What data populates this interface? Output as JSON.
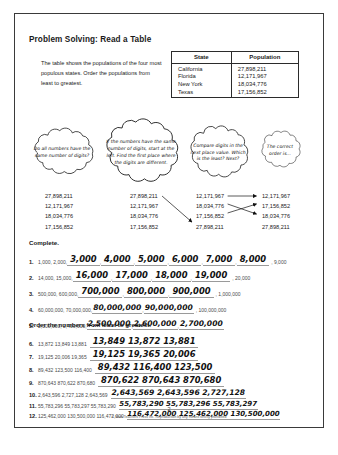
{
  "worksheet": {
    "title": "Problem Solving: Read a Table",
    "intro": "The table shows the populations of the four most populous states. Order the populations from least to greatest."
  },
  "table": {
    "headers": [
      "State",
      "Population"
    ],
    "rows": [
      {
        "state": "California",
        "population": "27,898,211"
      },
      {
        "state": "Florida",
        "population": "12,171,967"
      },
      {
        "state": "New York",
        "population": "18,034,776"
      },
      {
        "state": "Texas",
        "population": "17,156,852"
      }
    ]
  },
  "clouds": [
    {
      "id": "cloud-1",
      "text": "Do all numbers have the same number of digits?"
    },
    {
      "id": "cloud-2",
      "text": "If the numbers have the same number of digits, start at the left. Find the first place where the digits are different."
    },
    {
      "id": "cloud-3",
      "text": "Compare digits in the next place value. Which is the least? Next?"
    },
    {
      "id": "cloud-4",
      "text": "The correct order is..."
    }
  ],
  "number_columns": [
    {
      "name": "column-1",
      "values": [
        "27,898,211",
        "12,171,967",
        "18,034,776",
        "17,156,852"
      ]
    },
    {
      "name": "column-2",
      "values": [
        "27,898,211",
        "12,171,967",
        "18,034,776",
        "17,156,852"
      ]
    },
    {
      "name": "column-3",
      "values": [
        "12,171,967",
        "18,034,776",
        "17,156,852",
        "27,898,211"
      ]
    },
    {
      "name": "column-4",
      "values": [
        "12,171,967",
        "17,156,852",
        "18,034,776",
        "27,898,211"
      ]
    }
  ],
  "sections": {
    "complete": "Complete.",
    "order": "Order the numbers from least to greatest."
  },
  "complete_items": [
    {
      "n": "1.",
      "lead": "1,000, 2,000,",
      "answers": [
        "3,000",
        "4,000",
        "5,000",
        "6,000",
        "7,000",
        "8,000"
      ],
      "tail": "9,000"
    },
    {
      "n": "2.",
      "lead": "14,000, 15,000,",
      "answers": [
        "16,000",
        "17,000",
        "18,000",
        "19,000"
      ],
      "tail": "20,000"
    },
    {
      "n": "3.",
      "lead": "500,000, 600,000,",
      "answers": [
        "700,000",
        "800,000",
        "900,000"
      ],
      "tail": "1,000,000"
    },
    {
      "n": "4.",
      "lead": "60,000,000, 70,000,000,",
      "answers": [
        "80,000,000",
        "90,000,000"
      ],
      "tail": "100,000,000"
    },
    {
      "n": "5.",
      "lead": "2,300,000, 2,400,000,",
      "answers": [
        "2,500,000",
        "2,600,000",
        "2,700,000"
      ],
      "tail": ""
    }
  ],
  "order_items": [
    {
      "n": "6.",
      "given": "13,872    13,849    13,881",
      "answers": [
        "13,849",
        "13,872",
        "13,881"
      ]
    },
    {
      "n": "7.",
      "given": "19,125    20,006    19,365",
      "answers": [
        "19,125",
        "19,365",
        "20,006"
      ]
    },
    {
      "n": "8.",
      "given": "89,432    123,500    116,400",
      "answers": [
        "89,432",
        "116,400",
        "123,500"
      ]
    },
    {
      "n": "9.",
      "given": "870,643    870,622    870,680",
      "answers": [
        "870,622",
        "870,643",
        "870,680"
      ]
    },
    {
      "n": "10.",
      "given": "2,643,596    2,727,128    2,643,569",
      "answers": [
        "2,643,569",
        "2,643,596",
        "2,727,128"
      ]
    },
    {
      "n": "11.",
      "given": "55,783,296    55,783,297    55,783,290",
      "answers": [
        "55,783,290",
        "55,783,296",
        "55,783,297"
      ]
    },
    {
      "n": "12.",
      "given": "125,462,000    130,500,000    116,472,000",
      "answers": [
        "116,472,000",
        "125,462,000",
        "130,500,000"
      ]
    }
  ],
  "footer": {
    "page_number": "2",
    "copyright": "© Math Teachers Press Inc.  Reproduction by any means strictly prohibited"
  }
}
